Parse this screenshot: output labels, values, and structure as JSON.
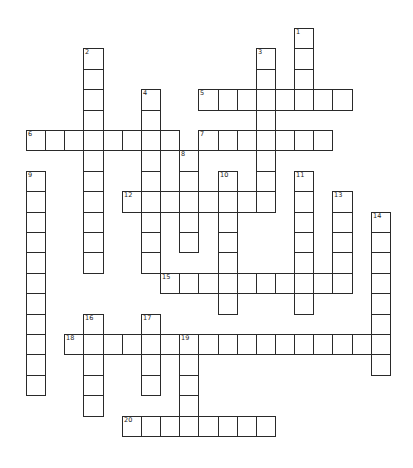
{
  "puzzle": {
    "grid": {
      "origin_x": 26,
      "origin_y": 28,
      "cell_width": 19.15,
      "cell_height": 20.4,
      "border_color": "#2a2a2a",
      "fill_color": "#ffffff"
    },
    "entries": [
      {
        "number": "1",
        "direction": "down",
        "col": 14,
        "row": 0,
        "length": 4
      },
      {
        "number": "2",
        "direction": "down",
        "col": 3,
        "row": 1,
        "length": 11
      },
      {
        "number": "3",
        "direction": "down",
        "col": 12,
        "row": 1,
        "length": 8
      },
      {
        "number": "4",
        "direction": "down",
        "col": 6,
        "row": 3,
        "length": 9
      },
      {
        "number": "5",
        "direction": "across",
        "col": 9,
        "row": 3,
        "length": 8
      },
      {
        "number": "6",
        "direction": "across",
        "col": 0,
        "row": 5,
        "length": 8
      },
      {
        "number": "7",
        "direction": "across",
        "col": 9,
        "row": 5,
        "length": 7
      },
      {
        "number": "8",
        "direction": "down",
        "col": 8,
        "row": 6,
        "length": 5
      },
      {
        "number": "9",
        "direction": "down",
        "col": 0,
        "row": 7,
        "length": 11
      },
      {
        "number": "10",
        "direction": "down",
        "col": 10,
        "row": 7,
        "length": 7
      },
      {
        "number": "11",
        "direction": "down",
        "col": 14,
        "row": 7,
        "length": 7
      },
      {
        "number": "12",
        "direction": "across",
        "col": 5,
        "row": 8,
        "length": 8
      },
      {
        "number": "13",
        "direction": "down",
        "col": 16,
        "row": 8,
        "length": 5
      },
      {
        "number": "14",
        "direction": "down",
        "col": 18,
        "row": 9,
        "length": 8
      },
      {
        "number": "15",
        "direction": "across",
        "col": 7,
        "row": 12,
        "length": 10
      },
      {
        "number": "16",
        "direction": "down",
        "col": 3,
        "row": 14,
        "length": 5
      },
      {
        "number": "17",
        "direction": "down",
        "col": 6,
        "row": 14,
        "length": 4
      },
      {
        "number": "18",
        "direction": "across",
        "col": 2,
        "row": 15,
        "length": 17
      },
      {
        "number": "19",
        "direction": "down",
        "col": 8,
        "row": 15,
        "length": 5
      },
      {
        "number": "20",
        "direction": "across",
        "col": 5,
        "row": 19,
        "length": 8
      }
    ]
  }
}
